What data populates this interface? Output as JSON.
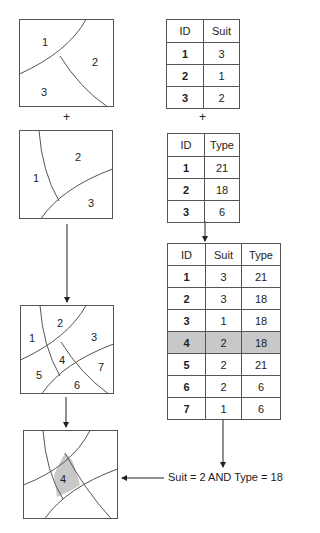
{
  "figure": {
    "plus_symbol": "+",
    "query_label": "Suit = 2 AND Type = 18",
    "highlight_color": "#c8c8c8",
    "line_color": "#555555"
  },
  "maps": [
    {
      "name": "suitability-layer",
      "labels": [
        "1",
        "2",
        "3"
      ]
    },
    {
      "name": "type-layer",
      "labels": [
        "1",
        "2",
        "3"
      ]
    },
    {
      "name": "overlay-result",
      "labels": [
        "1",
        "2",
        "3",
        "4",
        "5",
        "6",
        "7"
      ]
    },
    {
      "name": "query-result",
      "labels": [
        "4"
      ],
      "highlighted": "4"
    }
  ],
  "tables": {
    "suit": {
      "headers": [
        "ID",
        "Suit"
      ],
      "rows": [
        [
          "1",
          "3"
        ],
        [
          "2",
          "1"
        ],
        [
          "3",
          "2"
        ]
      ]
    },
    "type": {
      "headers": [
        "ID",
        "Type"
      ],
      "rows": [
        [
          "1",
          "21"
        ],
        [
          "2",
          "18"
        ],
        [
          "3",
          "6"
        ]
      ]
    },
    "combined": {
      "headers": [
        "ID",
        "Suit",
        "Type"
      ],
      "rows": [
        [
          "1",
          "3",
          "21"
        ],
        [
          "2",
          "3",
          "18"
        ],
        [
          "3",
          "1",
          "18"
        ],
        [
          "4",
          "2",
          "18"
        ],
        [
          "5",
          "2",
          "21"
        ],
        [
          "6",
          "2",
          "6"
        ],
        [
          "7",
          "1",
          "6"
        ]
      ],
      "highlighted_row_id": "4"
    }
  }
}
